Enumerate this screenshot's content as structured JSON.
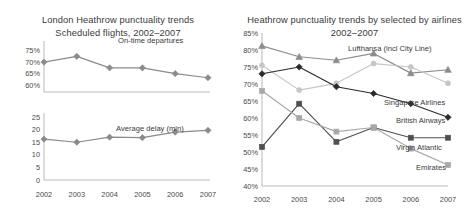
{
  "left_panel": {
    "title_line1": "London Heathrow punctuality trends",
    "title_line2": "Scheduled flights, 2002–2007"
  },
  "right_panel": {
    "title_line1": "Heathrow punctuality trends by selected by airlines",
    "title_line2": "2002–2007"
  },
  "colors": {
    "ontime": "#8a8a8a",
    "delay": "#8a8a8a",
    "lufthansa": "#8c8c8c",
    "singapore": "#c6c6c6",
    "british_airways": "#2b2b2b",
    "virgin_atlantic": "#5a5a5a",
    "emirates": "#a8a8a8",
    "axis": "#b9b9b9",
    "text": "#3b3b3b",
    "background": "#ffffff"
  },
  "chart_data": [
    {
      "type": "line",
      "id": "on-time-departures",
      "title": "London Heathrow punctuality trends / Scheduled flights, 2002–2007",
      "xlabel": "",
      "ylabel": "",
      "x": [
        "2002",
        "2003",
        "2004",
        "2005",
        "2006",
        "2007"
      ],
      "categories": [
        "2002",
        "2003",
        "2004",
        "2005",
        "2006",
        "2007"
      ],
      "yticks": [
        "60%",
        "65%",
        "70%",
        "75%"
      ],
      "ytick_values": [
        60,
        65,
        70,
        75
      ],
      "ylim": [
        57,
        77
      ],
      "grid": false,
      "legend_position": "inline-label",
      "series": [
        {
          "name": "On-time departures",
          "values": [
            70.0,
            72.5,
            67.5,
            67.5,
            65.0,
            63.2
          ],
          "marker": "diamond",
          "color": "#8a8a8a"
        }
      ]
    },
    {
      "type": "line",
      "id": "average-delay",
      "title": "",
      "xlabel": "",
      "ylabel": "",
      "x": [
        "2002",
        "2003",
        "2004",
        "2005",
        "2006",
        "2007"
      ],
      "categories": [
        "2002",
        "2003",
        "2004",
        "2005",
        "2006",
        "2007"
      ],
      "yticks": [
        "0",
        "5",
        "10",
        "15",
        "20",
        "25"
      ],
      "ytick_values": [
        0,
        5,
        10,
        15,
        20,
        25
      ],
      "ylim": [
        0,
        25
      ],
      "grid": false,
      "legend_position": "inline-label",
      "series": [
        {
          "name": "Average delay (min)",
          "values": [
            16.2,
            15.0,
            17.0,
            16.8,
            19.0,
            19.7
          ],
          "marker": "diamond",
          "color": "#8a8a8a"
        }
      ]
    },
    {
      "type": "line",
      "id": "airlines-punctuality",
      "title": "Heathrow punctuality trends by selected by airlines 2002–2007",
      "xlabel": "",
      "ylabel": "",
      "x": [
        "2002",
        "2003",
        "2004",
        "2005",
        "2006",
        "2007"
      ],
      "categories": [
        "2002",
        "2003",
        "2004",
        "2005",
        "2006",
        "2007"
      ],
      "yticks": [
        "40%",
        "45%",
        "50%",
        "55%",
        "60%",
        "65%",
        "70%",
        "75%",
        "80%",
        "85%"
      ],
      "ytick_values": [
        40,
        45,
        50,
        55,
        60,
        65,
        70,
        75,
        80,
        85
      ],
      "ylim": [
        40,
        85
      ],
      "grid": false,
      "legend_position": "right-inline-labels",
      "series": [
        {
          "name": "Lufthansa (incl City Line)",
          "values": [
            81.2,
            78.0,
            77.0,
            79.0,
            73.2,
            74.2
          ],
          "marker": "triangle",
          "color": "#8c8c8c"
        },
        {
          "name": "Singapore Airlines",
          "values": [
            75.5,
            68.2,
            70.2,
            76.0,
            75.0,
            70.2
          ],
          "marker": "circle",
          "color": "#c6c6c6"
        },
        {
          "name": "British Airways",
          "values": [
            73.0,
            75.0,
            69.2,
            67.2,
            64.2,
            60.2
          ],
          "marker": "diamond",
          "color": "#2b2b2b"
        },
        {
          "name": "Virgin Atlantic",
          "values": [
            51.5,
            64.2,
            53.0,
            57.2,
            54.2,
            54.2
          ],
          "marker": "square",
          "color": "#4f4f4f"
        },
        {
          "name": "Emirates",
          "values": [
            68.0,
            60.0,
            56.0,
            57.2,
            51.0,
            46.2
          ],
          "marker": "square",
          "color": "#a8a8a8"
        }
      ]
    }
  ]
}
